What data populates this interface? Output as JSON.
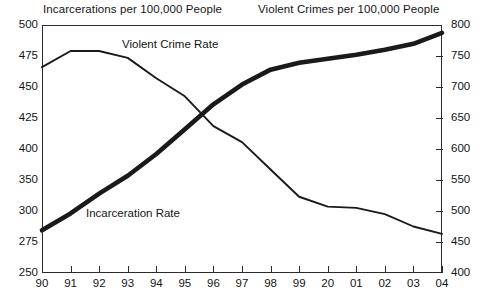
{
  "figure": {
    "left_axis_title": "Incarcerations per 100,000 People",
    "right_axis_title": "Violent Crimes per 100,000 People",
    "series_labels": {
      "incarceration": "Incarceration Rate",
      "violent_crime": "Violent Crime Rate"
    },
    "colors": {
      "line": "#1a1a1a",
      "frame": "#2b2b2b",
      "background": "#ffffff",
      "text": "#141414"
    }
  },
  "chart_data": {
    "type": "line",
    "title": "",
    "subtitle": "",
    "xlabel": "",
    "ylabel": "Incarcerations per 100,000 People",
    "y2label": "Violent Crimes per 100,000 People",
    "grid": false,
    "legend_position": "inline-annotation",
    "categories": [
      "90",
      "91",
      "92",
      "93",
      "94",
      "95",
      "96",
      "97",
      "98",
      "99",
      "20",
      "01",
      "02",
      "03",
      "04"
    ],
    "x_tick_labels": [
      "90",
      "91",
      "92",
      "93",
      "94",
      "95",
      "96",
      "97",
      "98",
      "99",
      "20",
      "01",
      "02",
      "03",
      "04"
    ],
    "y_tick_labels": [
      "500",
      "475",
      "450",
      "425",
      "400",
      "350",
      "300",
      "275",
      "250"
    ],
    "y2_tick_labels": [
      "800",
      "750",
      "700",
      "650",
      "600",
      "550",
      "500",
      "450",
      "400"
    ],
    "ylim": [
      250,
      500
    ],
    "y2lim": [
      400,
      800
    ],
    "series": [
      {
        "name": "Incarceration Rate",
        "axis": "left",
        "style": "thick",
        "values": [
          293,
          310,
          330,
          348,
          370,
          395,
          420,
          440,
          455,
          462,
          466,
          470,
          475,
          481,
          492
        ]
      },
      {
        "name": "Violent Crime Rate",
        "axis": "right",
        "style": "thin",
        "values": [
          732,
          758,
          758,
          747,
          714,
          685,
          637,
          611,
          567,
          523,
          507,
          505,
          495,
          475,
          463
        ]
      }
    ]
  }
}
